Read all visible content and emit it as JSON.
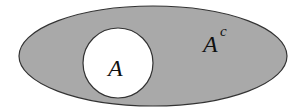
{
  "diagram": {
    "type": "venn-complement",
    "universe": {
      "fill": "#a9a9a9",
      "stroke": "#333333"
    },
    "set": {
      "label": "A",
      "fill": "#ffffff",
      "stroke": "#333333"
    },
    "complement": {
      "label_base": "A",
      "label_sup": "c"
    }
  }
}
